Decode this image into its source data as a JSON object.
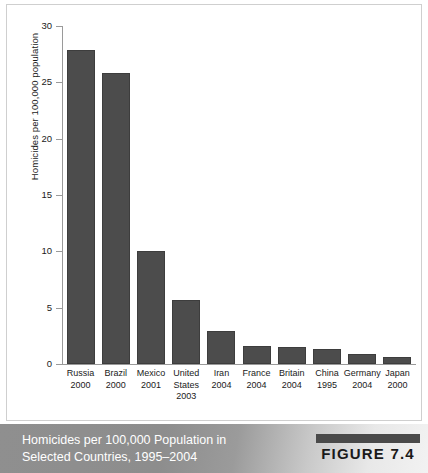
{
  "figure": {
    "caption_line1": "Homicides per 100,000 Population in",
    "caption_line2": "Selected Countries, 1995–2004",
    "badge_label": "FIGURE 7.4"
  },
  "colors": {
    "bar_fill": "#4c4c4c",
    "bar_stroke": "#3d3d3d",
    "axis": "#9a9a9a",
    "caption_band_left": "#8f8f8f",
    "caption_band_right": "#f2f2f2",
    "caption_text": "#ffffff",
    "panel_background": "#ffffff",
    "panel_border": "#cfcfcf"
  },
  "chart_data": {
    "type": "bar",
    "title": "",
    "xlabel": "",
    "ylabel": "Homicides per 100,000 population",
    "ylim": [
      0,
      30
    ],
    "yticks": [
      0,
      5,
      10,
      15,
      20,
      25,
      30
    ],
    "ytick_labels": [
      "0",
      "5",
      "10",
      "15",
      "20",
      "25",
      "30"
    ],
    "grid": false,
    "legend": false,
    "categories": [
      "Russia 2000",
      "Brazil 2000",
      "Mexico 2001",
      "United States 2003",
      "Iran 2004",
      "France 2004",
      "Britain 2004",
      "China 1995",
      "Germany 2004",
      "Japan 2000"
    ],
    "country_labels": [
      {
        "name": "Russia",
        "year": "2000"
      },
      {
        "name": "Brazil",
        "year": "2000"
      },
      {
        "name": "Mexico",
        "year": "2001"
      },
      {
        "name": "United States",
        "year": "2003"
      },
      {
        "name": "Iran",
        "year": "2004"
      },
      {
        "name": "France",
        "year": "2004"
      },
      {
        "name": "Britain",
        "year": "2004"
      },
      {
        "name": "China",
        "year": "1995"
      },
      {
        "name": "Germany",
        "year": "2004"
      },
      {
        "name": "Japan",
        "year": "2000"
      }
    ],
    "values": [
      27.9,
      25.8,
      10.0,
      5.7,
      2.9,
      1.6,
      1.5,
      1.3,
      0.9,
      0.6
    ]
  }
}
